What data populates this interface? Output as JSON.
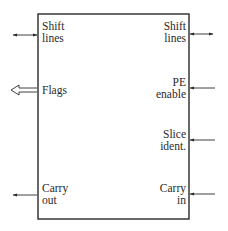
{
  "diagram": {
    "type": "block-diagram",
    "block": {
      "x": 38,
      "y": 14,
      "width": 151,
      "height": 205
    },
    "colors": {
      "line": "#2a2a2a",
      "background": "#ffffff"
    },
    "left_ports": [
      {
        "id": "shift-lines-left",
        "lines": [
          "Shift",
          "lines"
        ],
        "direction": "bidirectional",
        "arrow_style": "line",
        "y": 35
      },
      {
        "id": "flags",
        "lines": [
          "Flags"
        ],
        "direction": "out",
        "arrow_style": "hollow-bus",
        "y": 90
      },
      {
        "id": "carry-out",
        "lines": [
          "Carry",
          "out"
        ],
        "direction": "out",
        "arrow_style": "line",
        "y": 195
      }
    ],
    "right_ports": [
      {
        "id": "shift-lines-right",
        "lines": [
          "Shift",
          "lines"
        ],
        "direction": "bidirectional",
        "arrow_style": "line",
        "y": 34
      },
      {
        "id": "pe-enable",
        "lines": [
          "PE",
          "enable"
        ],
        "direction": "in",
        "arrow_style": "line",
        "y": 88
      },
      {
        "id": "slice-ident",
        "lines": [
          "Slice",
          "ident."
        ],
        "direction": "in",
        "arrow_style": "line",
        "y": 140
      },
      {
        "id": "carry-in",
        "lines": [
          "Carry",
          "in"
        ],
        "direction": "in",
        "arrow_style": "line",
        "y": 194
      }
    ]
  }
}
